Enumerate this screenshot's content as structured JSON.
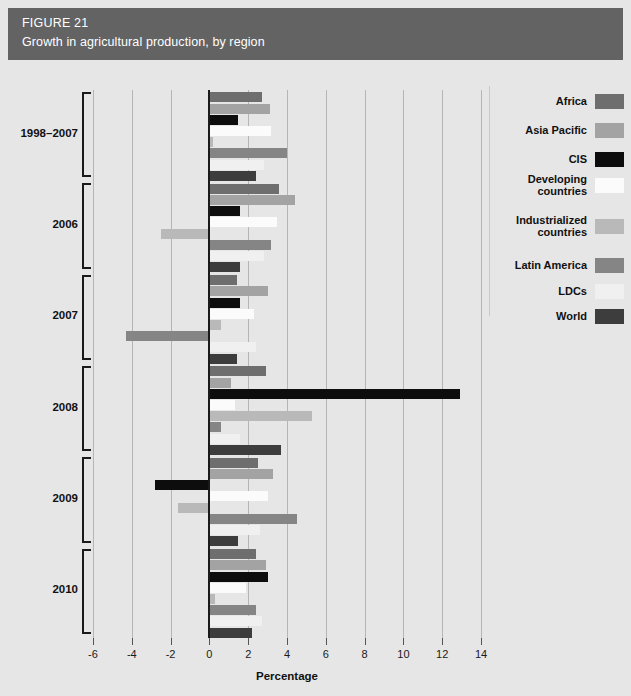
{
  "header": {
    "figure_number": "FIGURE 21",
    "title": "Growth in agricultural production, by region",
    "band_color": "#636363"
  },
  "legend": {
    "position": "right",
    "items": [
      {
        "label": "Africa",
        "color": "#6e6e6e"
      },
      {
        "label": "Asia Pacific",
        "color": "#a3a3a3"
      },
      {
        "label": "CIS",
        "color": "#0d0d0d"
      },
      {
        "label": "Developing\ncountries",
        "color": "#fbfbfb"
      },
      {
        "label": "Industrialized\ncountries",
        "color": "#b9b9b9"
      },
      {
        "label": "Latin America",
        "color": "#858585"
      },
      {
        "label": "LDCs",
        "color": "#f0f0f0"
      },
      {
        "label": "World",
        "color": "#3d3d3d"
      }
    ]
  },
  "axis": {
    "x_title": "Percentage",
    "x_ticks": [
      "-6",
      "-4",
      "-2",
      "0",
      "2",
      "4",
      "6",
      "8",
      "10",
      "12",
      "14"
    ],
    "x_tick_values": [
      -6,
      -4,
      -2,
      0,
      2,
      4,
      6,
      8,
      10,
      12,
      14
    ],
    "xlim": [
      -6,
      14
    ],
    "grid": "vertical"
  },
  "chart_data": {
    "type": "bar",
    "orientation": "horizontal",
    "title": "Growth in agricultural production, by region",
    "xlabel": "Percentage",
    "ylabel": "",
    "xlim": [
      -6,
      14
    ],
    "grid": true,
    "legend_position": "right",
    "categories": [
      "1998–2007",
      "2006",
      "2007",
      "2008",
      "2009",
      "2010"
    ],
    "series": [
      {
        "name": "Africa",
        "color": "#6e6e6e",
        "values": [
          2.7,
          3.6,
          1.4,
          2.9,
          2.5,
          2.4
        ]
      },
      {
        "name": "Asia Pacific",
        "color": "#a3a3a3",
        "values": [
          3.1,
          4.4,
          3.0,
          1.1,
          3.3,
          2.9
        ]
      },
      {
        "name": "CIS",
        "color": "#0d0d0d",
        "values": [
          1.5,
          1.6,
          1.6,
          12.9,
          -2.8,
          3.0
        ]
      },
      {
        "name": "Developing countries",
        "color": "#fbfbfb",
        "values": [
          3.2,
          3.5,
          2.3,
          1.3,
          3.0,
          1.9
        ]
      },
      {
        "name": "Industrialized countries",
        "color": "#b9b9b9",
        "values": [
          0.2,
          -2.5,
          0.6,
          5.3,
          -1.6,
          0.3
        ]
      },
      {
        "name": "Latin America",
        "color": "#858585",
        "values": [
          4.0,
          3.2,
          -4.3,
          0.6,
          4.5,
          2.4
        ]
      },
      {
        "name": "LDCs",
        "color": "#f0f0f0",
        "values": [
          2.8,
          2.8,
          2.4,
          1.6,
          2.6,
          2.7
        ]
      },
      {
        "name": "World",
        "color": "#3d3d3d",
        "values": [
          2.4,
          1.6,
          1.4,
          3.7,
          1.5,
          2.2
        ]
      }
    ]
  }
}
